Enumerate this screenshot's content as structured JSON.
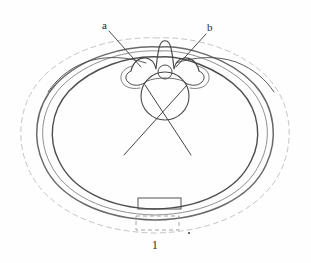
{
  "figure": {
    "background_color": "#fefefe",
    "width": 311,
    "height": 263
  },
  "labels": [
    {
      "id": "a",
      "text": "a",
      "x": 102,
      "y": 20,
      "points_to": "left-costovertebral-pressure-point"
    },
    {
      "id": "b",
      "text": "b",
      "x": 207,
      "y": 22,
      "points_to": "right-costovertebral-pressure-point"
    },
    {
      "id": "1",
      "text": "1",
      "x": 152,
      "y": 240,
      "points_to": "anterior-pad-element"
    }
  ],
  "leader_lines": [
    {
      "name": "leader-line-a",
      "x1": 108,
      "y1": 30,
      "x2": 141,
      "y2": 66,
      "color": "#3b3b3b"
    },
    {
      "name": "leader-line-b",
      "x1": 206,
      "y1": 33,
      "x2": 176,
      "y2": 66,
      "color": "#3b3b3b"
    }
  ],
  "crossing_lines": [
    {
      "name": "correction-force-line-left",
      "x1": 186,
      "y1": 86,
      "x2": 124,
      "y2": 155,
      "color": "#3a3a3a"
    },
    {
      "name": "correction-force-line-right",
      "x1": 146,
      "y1": 86,
      "x2": 190,
      "y2": 155,
      "color": "#3a3a3a"
    }
  ],
  "anatomy": {
    "vertebral_body": {
      "name": "vertebral-body",
      "cx": 165,
      "cy": 95,
      "r": 24
    },
    "spinal_canal": {
      "name": "spinal-canal",
      "cx": 165,
      "cy": 71,
      "r": 7
    },
    "spinous_process": {
      "name": "spinous-process",
      "apex_x": 165,
      "apex_y": 40
    },
    "rib_cage_outline": {
      "name": "rib-cage-contour"
    }
  },
  "orthosis": {
    "outer_dashed_contour": {
      "name": "outer-body-contour",
      "stroke": "#b9b9b9",
      "dash": "5 4"
    },
    "brace_outer_band": {
      "name": "brace-outer-band",
      "stroke": "#6e6e6e"
    },
    "brace_inner_band": {
      "name": "brace-inner-band",
      "stroke": "#4a4a4a"
    },
    "anterior_pad_solid": {
      "name": "anterior-pad-solid",
      "x": 138,
      "y": 198,
      "width": 42,
      "height": 11
    },
    "anterior_pad_dashed": {
      "name": "anterior-pad-dashed",
      "x": 136,
      "y": 216,
      "width": 42,
      "height": 14,
      "dash": "4 3"
    }
  },
  "marks": [
    {
      "name": "reference-dot",
      "x": 189,
      "y": 233,
      "r": 1.1,
      "color": "#4a4a4a"
    }
  ],
  "colors": {
    "ink_dark": "#3a3a3a",
    "ink_medium": "#6e6e6e",
    "ink_light": "#b9b9b9",
    "background": "#fefefe"
  }
}
